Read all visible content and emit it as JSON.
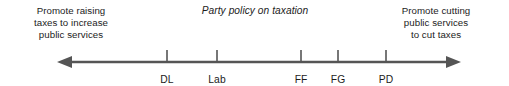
{
  "chart_data": {
    "type": "scatter",
    "title": "Party policy on taxation",
    "orientation": "horizontal-number-line",
    "xlabel": "",
    "ylabel": "",
    "grid": false,
    "legend": null,
    "axis": {
      "left_arrow": true,
      "right_arrow": true,
      "left_pole_label": "Promote raising taxes to increase public services",
      "right_pole_label": "Promote cutting public services to cut taxes",
      "row_label": "Seats",
      "color": "#555555"
    },
    "categories": [
      "DL",
      "Lab",
      "FF",
      "FG",
      "PD"
    ],
    "values": [
      4,
      33,
      68,
      45,
      10
    ],
    "value_series_name": "Seats",
    "points": [
      {
        "label": "DL",
        "seats": 4,
        "x_px": 167
      },
      {
        "label": "Lab",
        "seats": 33,
        "x_px": 217
      },
      {
        "label": "FF",
        "seats": 68,
        "x_px": 301
      },
      {
        "label": "FG",
        "seats": 45,
        "x_px": 338
      },
      {
        "label": "PD",
        "seats": 10,
        "x_px": 386
      }
    ]
  },
  "left_note": {
    "lines": [
      "Promote raising",
      "taxes to increase",
      "public services"
    ]
  },
  "right_note": {
    "lines": [
      "Promote cutting",
      "public services",
      "to cut taxes"
    ]
  },
  "title": {
    "text": "Party policy on taxation"
  },
  "seats": {
    "label": "Seats"
  },
  "colors": {
    "axis": "#555555",
    "text": "#1c1c1c",
    "background": "#ffffff"
  }
}
